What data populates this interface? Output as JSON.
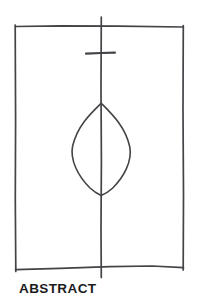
{
  "figure": {
    "caption": "ABSTRACT",
    "style": {
      "background_color": "#ffffff",
      "stroke_color": "#434348",
      "caption_color": "#1c1c1e"
    },
    "elements": {
      "frame": {
        "name": "rectangular-frame",
        "left_edge_x": 15,
        "right_edge_x": 183,
        "top_edge_y": 26,
        "bottom_edge_y": 268
      },
      "center_axis": {
        "name": "vertical-center-line",
        "x": 101,
        "top_y": 17,
        "bottom_y": 277
      },
      "tick_mark": {
        "name": "horizontal-tick-mark",
        "y": 53,
        "left_x": 86,
        "right_x": 115
      },
      "lens": {
        "name": "leaf-lens-shape",
        "apex_top_y": 103,
        "apex_bottom_y": 195,
        "left_x": 72,
        "right_x": 130,
        "center_x": 101
      }
    }
  }
}
